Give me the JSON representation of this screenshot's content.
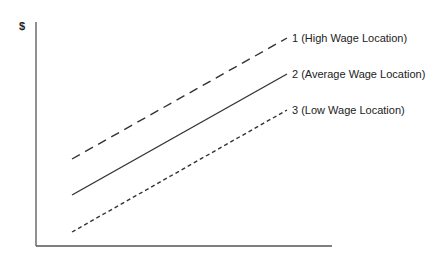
{
  "diagram": {
    "y_axis_label": "$",
    "lines": [
      {
        "id": "1",
        "label": "1 (High Wage Location)",
        "style": "long-dash",
        "x1": 72,
        "y1": 159,
        "x2": 287,
        "y2": 38
      },
      {
        "id": "2",
        "label": "2 (Average Wage Location)",
        "style": "solid",
        "x1": 72,
        "y1": 195,
        "x2": 287,
        "y2": 74
      },
      {
        "id": "3",
        "label": "3 (Low Wage Location)",
        "style": "short-dash",
        "x1": 72,
        "y1": 232,
        "x2": 287,
        "y2": 110
      }
    ],
    "colors": {
      "line": "#333333",
      "axis": "#555555",
      "text": "#222222"
    }
  }
}
